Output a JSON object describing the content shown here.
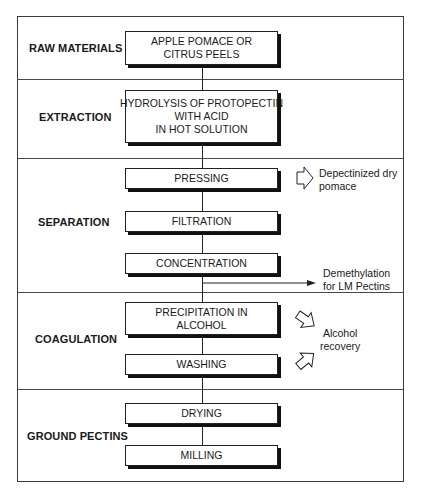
{
  "diagram": {
    "stages": [
      {
        "label": "RAW MATERIALS",
        "steps": [
          {
            "lines": [
              "APPLE POMACE OR",
              "CITRUS PEELS"
            ]
          }
        ]
      },
      {
        "label": "EXTRACTION",
        "steps": [
          {
            "lines": [
              "HYDROLYSIS OF PROTOPECTIN",
              "WITH ACID",
              "IN HOT SOLUTION"
            ]
          }
        ]
      },
      {
        "label": "SEPARATION",
        "steps": [
          {
            "lines": [
              "PRESSING"
            ]
          },
          {
            "lines": [
              "FILTRATION"
            ]
          },
          {
            "lines": [
              "CONCENTRATION"
            ]
          }
        ]
      },
      {
        "label": "COAGULATION",
        "steps": [
          {
            "lines": [
              "PRECIPITATION IN",
              "ALCOHOL"
            ]
          },
          {
            "lines": [
              "WASHING"
            ]
          }
        ]
      },
      {
        "label": "GROUND PECTINS",
        "steps": [
          {
            "lines": [
              "DRYING"
            ]
          },
          {
            "lines": [
              "MILLING"
            ]
          }
        ]
      }
    ],
    "side_outputs": {
      "pressing": {
        "lines": [
          "Depectinized dry",
          "pomace"
        ],
        "icon": "hollow-arrow-right"
      },
      "concentration": {
        "lines": [
          "Demethylation",
          "for LM Pectins"
        ],
        "icon": "line-arrow-right"
      },
      "alcohol": {
        "lines": [
          "Alcohol",
          "recovery"
        ],
        "icons": [
          "hollow-arrow-down-right",
          "hollow-arrow-up-right"
        ]
      }
    },
    "colors": {
      "line": "#222222",
      "shadow": "#111111",
      "background": "#ffffff"
    }
  }
}
